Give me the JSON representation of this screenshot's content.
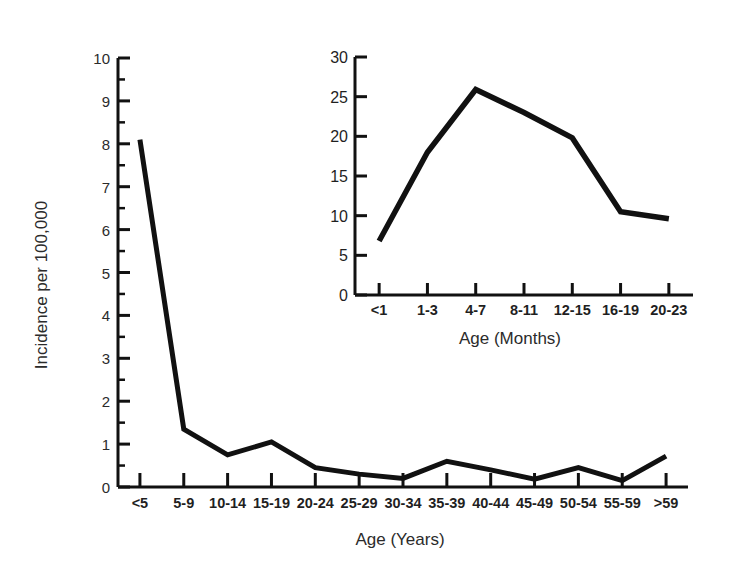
{
  "figure": {
    "background_color": "#ffffff",
    "line_color": "#111111",
    "text_color": "#2b2b2b"
  },
  "chart_data": [
    {
      "id": "main",
      "type": "line",
      "title": "",
      "xlabel": "Age (Years)",
      "ylabel": "Incidence per 100,000",
      "categories": [
        "<5",
        "5-9",
        "10-14",
        "15-19",
        "20-24",
        "25-29",
        "30-34",
        "35-39",
        "40-44",
        "45-49",
        "50-54",
        "55-59",
        ">59"
      ],
      "values": [
        8.1,
        1.35,
        0.75,
        1.05,
        0.45,
        0.3,
        0.2,
        0.6,
        0.4,
        0.18,
        0.45,
        0.15,
        0.72
      ],
      "ylim": [
        0,
        10
      ],
      "ytick_labels": [
        "0",
        "1",
        "2",
        "3",
        "4",
        "5",
        "6",
        "7",
        "8",
        "9",
        "10"
      ],
      "ytick_values": [
        0,
        1,
        2,
        3,
        4,
        5,
        6,
        7,
        8,
        9,
        10
      ],
      "grid": false,
      "legend": "none"
    },
    {
      "id": "inset",
      "type": "line",
      "title": "",
      "xlabel": "Age (Months)",
      "ylabel": "",
      "categories": [
        "<1",
        "1-3",
        "4-7",
        "8-11",
        "12-15",
        "16-19",
        "20-23"
      ],
      "values": [
        6.8,
        18.0,
        25.9,
        23.0,
        19.8,
        10.5,
        9.6
      ],
      "ylim": [
        0,
        30
      ],
      "ytick_labels": [
        "0",
        "5",
        "10",
        "15",
        "20",
        "25",
        "30"
      ],
      "ytick_values": [
        0,
        5,
        10,
        15,
        20,
        25,
        30
      ],
      "grid": false,
      "legend": "none"
    }
  ]
}
